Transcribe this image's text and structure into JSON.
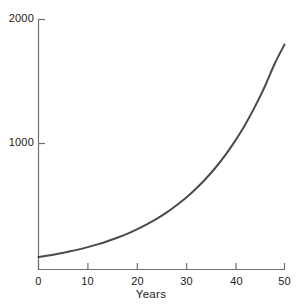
{
  "chart_data": {
    "type": "line",
    "title": "",
    "subtitle": "",
    "xlabel": "Years",
    "ylabel": "",
    "xlim": [
      0,
      50
    ],
    "ylim": [
      0,
      2000
    ],
    "grid": false,
    "legend": null,
    "x_ticks": [
      0,
      10,
      20,
      30,
      40,
      50
    ],
    "x_tick_labels": [
      "0",
      "10",
      "20",
      "30",
      "40",
      "50"
    ],
    "y_ticks": [
      1000,
      2000
    ],
    "y_tick_labels": [
      "1000",
      "2000"
    ],
    "series": [
      {
        "name": "growth",
        "color": "#4a4a4a",
        "line_width": 2.0,
        "x": [
          0,
          2,
          4,
          6,
          8,
          10,
          12,
          14,
          16,
          18,
          20,
          22,
          24,
          26,
          28,
          30,
          32,
          34,
          36,
          38,
          40,
          42,
          44,
          46,
          48,
          50
        ],
        "values": [
          100,
          112,
          126,
          142,
          159,
          179,
          201,
          226,
          254,
          285,
          321,
          361,
          405,
          455,
          512,
          574,
          646,
          726,
          816,
          917,
          1031,
          1159,
          1303,
          1464,
          1646,
          1800
        ]
      }
    ],
    "annotations": []
  },
  "axes": {
    "axis_color": "#6f6f6f",
    "text_color": "#1a1a1a",
    "background": "#ffffff",
    "tick_direction": "in"
  },
  "labels": {
    "xlabel": "Years",
    "y_top": "2000",
    "y_mid": "1000",
    "x0": "0",
    "x10": "10",
    "x20": "20",
    "x30": "30",
    "x40": "40",
    "x50": "50"
  }
}
